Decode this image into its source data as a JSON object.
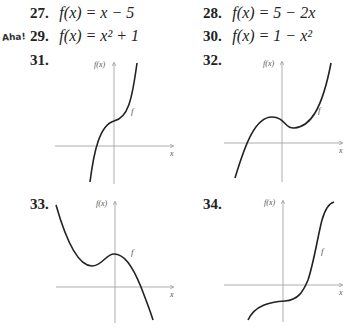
{
  "exercises": [
    {
      "number": "27.",
      "lhs": "f(x)",
      "rhs": "= x − 5"
    },
    {
      "number": "28.",
      "lhs": "f(x)",
      "rhs": "= 5 − 2x"
    },
    {
      "number": "29.",
      "lhs": "f(x)",
      "rhs": "= x² + 1"
    },
    {
      "number": "30.",
      "lhs": "f(x)",
      "rhs": "= 1 − x²"
    }
  ],
  "aha_label": "Aha!",
  "graphs": [
    {
      "number": "31.",
      "y_label": "f(x)",
      "x_label": "x",
      "curve_label": "f"
    },
    {
      "number": "32.",
      "y_label": "f(x)",
      "x_label": "x",
      "curve_label": "f"
    },
    {
      "number": "33.",
      "y_label": "f(x)",
      "x_label": "x",
      "curve_label": "f"
    },
    {
      "number": "34.",
      "y_label": "f(x)",
      "x_label": "x",
      "curve_label": "f"
    }
  ]
}
